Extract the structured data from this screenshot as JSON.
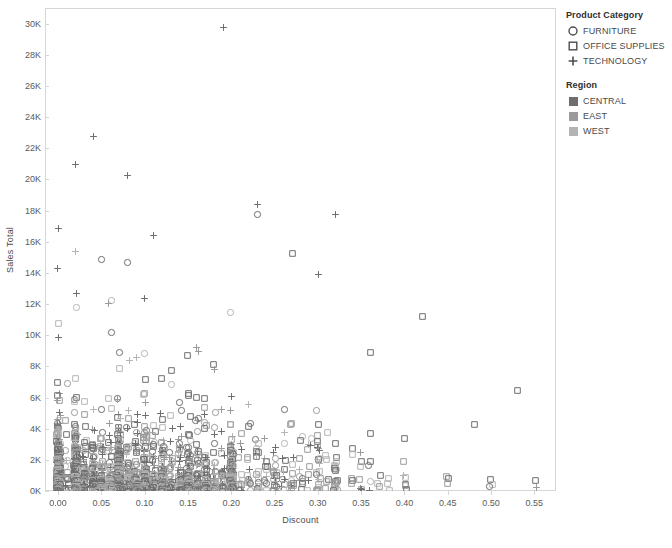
{
  "chart_data": {
    "type": "scatter",
    "title": "",
    "xlabel": "Discount",
    "ylabel": "Sales Total",
    "xlim": [
      -0.015,
      0.575
    ],
    "ylim": [
      0,
      31000
    ],
    "xticks": [
      "0.00",
      "0.05",
      "0.10",
      "0.15",
      "0.20",
      "0.25",
      "0.30",
      "0.35",
      "0.40",
      "0.45",
      "0.50",
      "0.55"
    ],
    "xtick_values": [
      0.0,
      0.05,
      0.1,
      0.15,
      0.2,
      0.25,
      0.3,
      0.35,
      0.4,
      0.45,
      0.5,
      0.55
    ],
    "yticks": [
      "0K",
      "2K",
      "4K",
      "6K",
      "8K",
      "10K",
      "12K",
      "14K",
      "16K",
      "18K",
      "20K",
      "22K",
      "24K",
      "26K",
      "28K",
      "30K"
    ],
    "ytick_values": [
      0,
      2000,
      4000,
      6000,
      8000,
      10000,
      12000,
      14000,
      16000,
      18000,
      20000,
      22000,
      24000,
      26000,
      28000,
      30000
    ],
    "grid": false,
    "legend_position": "right",
    "marker_encoding": "Product Category",
    "color_encoding": "Region",
    "category_markers": {
      "FURNITURE": "circle",
      "OFFICE SUPPLIES": "square",
      "TECHNOLOGY": "plus"
    },
    "region_colors": {
      "CENTRAL": "#6e6e6e",
      "EAST": "#9a9a9a",
      "WEST": "#b4b4b4"
    },
    "notable_points": [
      {
        "x": 0.19,
        "y": 29800,
        "category": "TECHNOLOGY",
        "region": "CENTRAL"
      },
      {
        "x": 0.04,
        "y": 22800,
        "category": "TECHNOLOGY",
        "region": "CENTRAL"
      },
      {
        "x": 0.02,
        "y": 21000,
        "category": "TECHNOLOGY",
        "region": "CENTRAL"
      },
      {
        "x": 0.08,
        "y": 20300,
        "category": "TECHNOLOGY",
        "region": "CENTRAL"
      },
      {
        "x": 0.23,
        "y": 18400,
        "category": "TECHNOLOGY",
        "region": "CENTRAL"
      },
      {
        "x": 0.23,
        "y": 17800,
        "category": "FURNITURE",
        "region": "CENTRAL"
      },
      {
        "x": 0.32,
        "y": 17800,
        "category": "TECHNOLOGY",
        "region": "CENTRAL"
      },
      {
        "x": 0.0,
        "y": 16900,
        "category": "TECHNOLOGY",
        "region": "CENTRAL"
      },
      {
        "x": 0.11,
        "y": 16400,
        "category": "TECHNOLOGY",
        "region": "CENTRAL"
      },
      {
        "x": 0.05,
        "y": 14900,
        "category": "FURNITURE",
        "region": "CENTRAL"
      },
      {
        "x": 0.08,
        "y": 14700,
        "category": "FURNITURE",
        "region": "CENTRAL"
      },
      {
        "x": 0.27,
        "y": 15300,
        "category": "OFFICE SUPPLIES",
        "region": "CENTRAL"
      },
      {
        "x": 0.3,
        "y": 13900,
        "category": "TECHNOLOGY",
        "region": "CENTRAL"
      },
      {
        "x": 0.42,
        "y": 11200,
        "category": "OFFICE SUPPLIES",
        "region": "CENTRAL"
      },
      {
        "x": 0.36,
        "y": 8900,
        "category": "OFFICE SUPPLIES",
        "region": "CENTRAL"
      },
      {
        "x": 0.53,
        "y": 6500,
        "category": "OFFICE SUPPLIES",
        "region": "CENTRAL"
      },
      {
        "x": 0.48,
        "y": 4300,
        "category": "OFFICE SUPPLIES",
        "region": "CENTRAL"
      },
      {
        "x": 0.4,
        "y": 3400,
        "category": "OFFICE SUPPLIES",
        "region": "CENTRAL"
      },
      {
        "x": 0.36,
        "y": 3700,
        "category": "OFFICE SUPPLIES",
        "region": "CENTRAL"
      },
      {
        "x": 0.32,
        "y": 3100,
        "category": "OFFICE SUPPLIES",
        "region": "CENTRAL"
      }
    ]
  },
  "legend": {
    "category": {
      "title": "Product Category",
      "items": [
        {
          "label": "FURNITURE",
          "glyph": "circle-marker-icon"
        },
        {
          "label": "OFFICE SUPPLIES",
          "glyph": "square-marker-icon"
        },
        {
          "label": "TECHNOLOGY",
          "glyph": "plus-marker-icon"
        }
      ]
    },
    "region": {
      "title": "Region",
      "items": [
        {
          "label": "CENTRAL",
          "color": "#6e6e6e"
        },
        {
          "label": "EAST",
          "color": "#9a9a9a"
        },
        {
          "label": "WEST",
          "color": "#b4b4b4"
        }
      ]
    }
  }
}
